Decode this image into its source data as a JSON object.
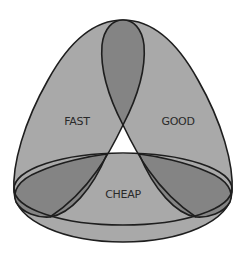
{
  "diagram": {
    "colors": {
      "background": "#ffffff",
      "region_fill": "#a9a9a9",
      "overlap_fill": "#848484",
      "center_fill": "#ffffff",
      "stroke": "#1e1e1e",
      "text": "#2a2a2a"
    },
    "sets": [
      {
        "id": "fast",
        "label": "FAST"
      },
      {
        "id": "good",
        "label": "GOOD"
      },
      {
        "id": "cheap",
        "label": "CHEAP"
      }
    ]
  }
}
